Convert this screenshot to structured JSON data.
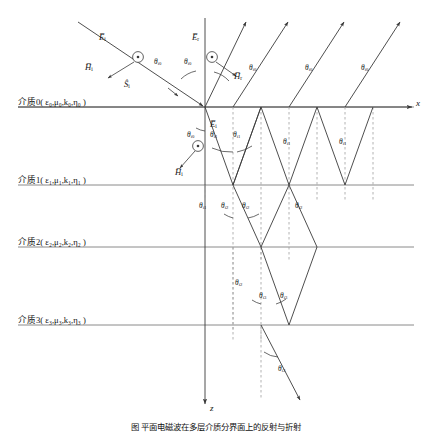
{
  "figure": {
    "caption": "图  平面电磁波在多层介质分界面上的反射与折射"
  },
  "axes": {
    "x_label": "x",
    "z_label": "z",
    "x_axis_y": 107,
    "z_axis_x": 205
  },
  "media": [
    {
      "id": "medium-0",
      "label": "介质0( ε₀,μ₀,k₀,η₀ )",
      "interface_y": 107
    },
    {
      "id": "medium-1",
      "label": "介质1( ε₁,μ₁,k₁,η₁ )",
      "interface_y": 185
    },
    {
      "id": "medium-2",
      "label": "介质2( ε₂,μ₂,k₂,η₂ )",
      "interface_y": 247
    },
    {
      "id": "medium-3",
      "label": "介质3( ε₃,μ₃,k₃,η₃ )",
      "interface_y": 325
    }
  ],
  "field_labels": [
    {
      "name": "incident-E",
      "text": "E̅",
      "sub": "i",
      "x": 99,
      "y": 33
    },
    {
      "name": "incident-H",
      "text": "H̅",
      "sub": "i",
      "x": 89,
      "y": 65
    },
    {
      "name": "incident-S",
      "text": "Ŝ",
      "sub": "i",
      "x": 126,
      "y": 78
    },
    {
      "name": "reflected-E",
      "text": "E̅",
      "sub": "r",
      "x": 190,
      "y": 33
    },
    {
      "name": "reflected-H",
      "text": "H̅",
      "sub": "r",
      "x": 204,
      "y": 66
    },
    {
      "name": "transmitted-E",
      "text": "E̅",
      "sub": "t",
      "x": 211,
      "y": 122
    },
    {
      "name": "transmitted-H",
      "text": "H̅",
      "sub": "t",
      "x": 196,
      "y": 160
    }
  ],
  "angle_labels": [
    {
      "name": "theta-i0-incident",
      "sym": "θ",
      "sub": "i0",
      "x": 157,
      "y": 60
    },
    {
      "name": "theta-i0-reflected",
      "sym": "θ",
      "sub": "i0",
      "x": 183,
      "y": 60
    },
    {
      "name": "theta-i0-r2",
      "sym": "θ",
      "sub": "i0",
      "x": 250,
      "y": 66
    },
    {
      "name": "theta-i0-r3",
      "sym": "θ",
      "sub": "i0",
      "x": 303,
      "y": 66
    },
    {
      "name": "theta-i0-r4",
      "sym": "θ",
      "sub": "i0",
      "x": 358,
      "y": 66
    },
    {
      "name": "theta-i0-refracted",
      "sym": "θ",
      "sub": "i0",
      "x": 188,
      "y": 134
    },
    {
      "name": "theta-i1-left",
      "sym": "θ",
      "sub": "i1",
      "x": 211,
      "y": 133
    },
    {
      "name": "theta-i1-right",
      "sym": "θ",
      "sub": "i1",
      "x": 234,
      "y": 133
    },
    {
      "name": "theta-i1-up1",
      "sym": "θ",
      "sub": "i1",
      "x": 284,
      "y": 140
    },
    {
      "name": "theta-i1-up2",
      "sym": "θ",
      "sub": "i1",
      "x": 340,
      "y": 140
    },
    {
      "name": "theta-i1-b1",
      "sym": "θ",
      "sub": "i1",
      "x": 200,
      "y": 204
    },
    {
      "name": "theta-i2-left",
      "sym": "θ",
      "sub": "i2",
      "x": 222,
      "y": 204
    },
    {
      "name": "theta-i2-right",
      "sym": "θ",
      "sub": "i2",
      "x": 243,
      "y": 204
    },
    {
      "name": "theta-i2-up",
      "sym": "θ",
      "sub": "i2",
      "x": 296,
      "y": 204
    },
    {
      "name": "theta-i2-b1",
      "sym": "θ",
      "sub": "i2",
      "x": 236,
      "y": 281
    },
    {
      "name": "theta-i3-left",
      "sym": "θ",
      "sub": "i3",
      "x": 260,
      "y": 294
    },
    {
      "name": "theta-i3-right",
      "sym": "θ",
      "sub": "i3",
      "x": 281,
      "y": 294
    },
    {
      "name": "theta-i3-bottom",
      "sym": "θ",
      "sub": "i3",
      "x": 279,
      "y": 367
    }
  ],
  "colors": {
    "line": "#3a3a3a",
    "interface": "#808080",
    "dashed": "#9a9a9a",
    "text": "#111111"
  }
}
